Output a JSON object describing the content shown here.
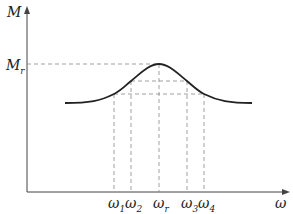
{
  "axes": {
    "y_label": "M",
    "x_label": "ω",
    "peak_label": "M",
    "peak_label_sub": "r"
  },
  "ticks": [
    {
      "sym": "ω",
      "sub": "1"
    },
    {
      "sym": "ω",
      "sub": "2"
    },
    {
      "sym": "ω",
      "sub": "r"
    },
    {
      "sym": "ω",
      "sub": "3"
    },
    {
      "sym": "ω",
      "sub": "4"
    }
  ],
  "colors": {
    "curve": "#222222",
    "axis": "#444444",
    "dashed": "#888888"
  }
}
